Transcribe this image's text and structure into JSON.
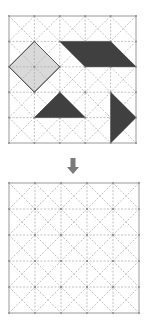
{
  "diagram": {
    "grid_size": 5,
    "colors": {
      "background": "#ffffff",
      "grid_line": "#a8a8a8",
      "border": "#9a9a9a",
      "light_shape": "#d9d9d9",
      "dark_shape": "#404040",
      "arrow": "#7a7a7a"
    },
    "top_grid": {
      "x": 9,
      "y": 16,
      "size": 127,
      "shapes": [
        {
          "name": "light-square",
          "fill": "light",
          "points": [
            [
              0,
              2
            ],
            [
              1,
              1
            ],
            [
              2,
              2
            ],
            [
              1,
              3
            ]
          ]
        },
        {
          "name": "dark-parallelogram",
          "fill": "dark",
          "points": [
            [
              2,
              1
            ],
            [
              4,
              1
            ],
            [
              5,
              2
            ],
            [
              3,
              2
            ]
          ]
        },
        {
          "name": "dark-triangle",
          "fill": "dark",
          "points": [
            [
              2,
              3
            ],
            [
              3,
              4
            ],
            [
              1,
              4
            ]
          ]
        },
        {
          "name": "dark-right-triangle",
          "fill": "dark",
          "points": [
            [
              4,
              3
            ],
            [
              5,
              4
            ],
            [
              4,
              5
            ]
          ]
        }
      ]
    },
    "arrow": {
      "direction": "down",
      "x": 73,
      "y": 158
    },
    "bottom_grid": {
      "x": 9,
      "y": 183,
      "size": 130,
      "shapes": []
    }
  }
}
